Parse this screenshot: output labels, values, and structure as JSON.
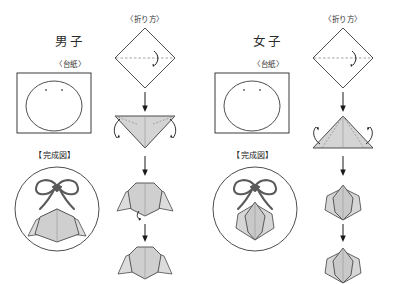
{
  "page": {
    "width": 396,
    "height": 284,
    "background": "#ffffff",
    "title_note": "Origami folding instructions sheet for boy and girl paper dolls"
  },
  "palette": {
    "ink": "#2a2a2a",
    "line": "#3a3a3a",
    "paper_fill": "#d4d4d4",
    "paper_fill_light": "#e2e2e2",
    "paper_fill_dark": "#c2c2c2",
    "fold_dash": "#8a8a8a",
    "arrow": "#1a1a1a",
    "ribbon": "#555555",
    "circle_stroke": "#3a3a3a"
  },
  "columns": [
    {
      "id": "male",
      "gender_label": "男子",
      "base_label": "〈台紙〉",
      "method_label": "〈折り方〉",
      "finished_label": "【完成図】",
      "base_card": {
        "shape": "square-with-face-circle",
        "eyes": 2
      },
      "steps": [
        {
          "index": 1,
          "shape": "diamond",
          "fold": "horizontal-dashed",
          "arrow": "curved-right-down"
        },
        {
          "index": 2,
          "shape": "triangle-down",
          "fold": "two-diagonal-dashed",
          "arrow": "two-curved-outward-down"
        },
        {
          "index": 3,
          "shape": "collar-with-wings",
          "arrow": "small-curl-up"
        },
        {
          "index": 4,
          "shape": "collar-final",
          "arrow": "none"
        }
      ],
      "finished": {
        "ornament": "bow-ribbon",
        "body": "collar-with-wings"
      }
    },
    {
      "id": "female",
      "gender_label": "女子",
      "base_label": "〈台紙〉",
      "method_label": "〈折り方〉",
      "finished_label": "【完成図】",
      "base_card": {
        "shape": "square-with-face-circle",
        "eyes": 2
      },
      "steps": [
        {
          "index": 1,
          "shape": "diamond",
          "fold": "horizontal-dashed",
          "arrow": "curved-right-down"
        },
        {
          "index": 2,
          "shape": "triangle-up",
          "fold": "two-diagonal-dashed",
          "arrow": "two-curved-outward-up"
        },
        {
          "index": 3,
          "shape": "tulip-petals",
          "arrow": "none"
        },
        {
          "index": 4,
          "shape": "tulip-final",
          "arrow": "none"
        }
      ],
      "finished": {
        "ornament": "bow-ribbon",
        "body": "tulip-petals"
      }
    }
  ]
}
